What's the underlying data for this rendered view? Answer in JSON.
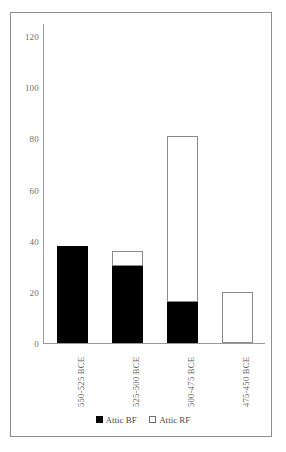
{
  "chart_data": {
    "type": "bar",
    "stacked": true,
    "title": "",
    "subtitle": "",
    "xlabel": "",
    "ylabel": "",
    "categories": [
      "550-525 BCE",
      "525-500 BCE",
      "500-475 BCE",
      "475-450 BCE"
    ],
    "series": [
      {
        "name": "Attic BF",
        "color": "#000000",
        "values": [
          38,
          30,
          16,
          0
        ]
      },
      {
        "name": "Attic RF",
        "color": "#ffffff",
        "values": [
          0,
          6,
          65,
          20
        ]
      }
    ],
    "totals": [
      38,
      36,
      81,
      20
    ],
    "ylim": [
      0,
      120
    ],
    "yticks": [
      0,
      20,
      40,
      60,
      80,
      100,
      120
    ],
    "ytick_labels": [
      "0",
      "20",
      "40",
      "60",
      "80",
      "100",
      "120"
    ],
    "grid": false,
    "legend_position": "bottom-center",
    "legend": [
      {
        "label": "Attic BF",
        "swatch": "filled-black-square"
      },
      {
        "label": "Attic RF",
        "swatch": "open-white-square"
      }
    ],
    "frame": true,
    "axis_color": "#9a9a9a",
    "text_color": "#6f6f6f"
  }
}
